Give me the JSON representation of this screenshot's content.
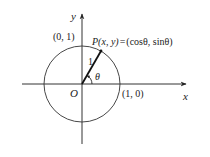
{
  "diagram": {
    "type": "unit-circle",
    "axes": {
      "x_label": "x",
      "y_label": "y",
      "origin_label": "O"
    },
    "circle": {
      "radius_label": "1"
    },
    "points": {
      "y_intercept": "(0, 1)",
      "x_intercept": "(1, 0)"
    },
    "point_p": {
      "label": "P(x, y) = (cosθ, sinθ)",
      "name": "P",
      "coords": "(x, y)",
      "eq": "=",
      "value": "(cosθ, sinθ)"
    },
    "angle": {
      "label": "θ"
    },
    "colors": {
      "stroke": "#222222",
      "background": "#ffffff"
    }
  }
}
